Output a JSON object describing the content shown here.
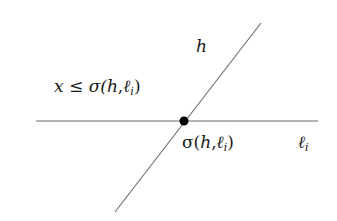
{
  "diagram": {
    "lines": [
      {
        "name": "horizontal-line-l_i",
        "x1": 36,
        "y1": 121,
        "x2": 318,
        "y2": 121
      },
      {
        "name": "line-h",
        "x1": 261,
        "y1": 23,
        "x2": 115,
        "y2": 212
      }
    ],
    "intersection_point": {
      "x": 184,
      "y": 121,
      "r": 4.5
    },
    "labels": {
      "h": "h",
      "constraint_prefix": "x ≤ σ(",
      "constraint_h": "h",
      "constraint_sep": ",",
      "constraint_l": "ℓ",
      "constraint_sub": "i",
      "constraint_close": ")",
      "point_prefix": "σ(",
      "point_h": "h",
      "point_sep": ",",
      "point_l": "ℓ",
      "point_sub": "i",
      "point_close": ")",
      "line_l": "ℓ",
      "line_l_sub": "i"
    },
    "colors": {
      "line": "#6a6a6a",
      "point": "#000000",
      "text": "#1a1a1a"
    }
  }
}
